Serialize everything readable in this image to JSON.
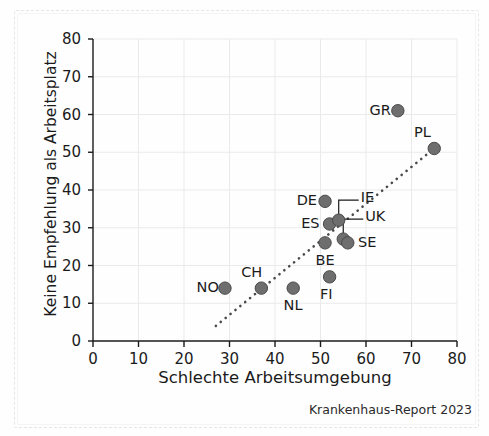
{
  "figure": {
    "source_note": "Krankenhaus-Report 2023"
  },
  "chart_data": {
    "type": "scatter",
    "title": "",
    "subtitle": "",
    "xlabel": "Schlechte Arbeitsumgebung",
    "ylabel": "Keine Empfehlung als Arbeitsplatz",
    "xlim": [
      0,
      80
    ],
    "ylim": [
      0,
      80
    ],
    "xticks": [
      0,
      10,
      20,
      30,
      40,
      50,
      60,
      70,
      80
    ],
    "yticks": [
      0,
      10,
      20,
      30,
      40,
      50,
      60,
      70,
      80
    ],
    "grid": true,
    "legend": "none",
    "marker_color": "#6e6e6e",
    "marker_edge_color": "#4a4a4a",
    "trendline": {
      "style": "dotted",
      "color": "#4a4a4a",
      "x_start": 27,
      "y_start": 4,
      "x_end": 76,
      "y_end": 52
    },
    "annotations": [
      {
        "label": "IE",
        "leader": true
      },
      {
        "label": "UK",
        "leader": true
      }
    ],
    "points": [
      {
        "label": "NO",
        "x": 29,
        "y": 14,
        "label_pos": "left"
      },
      {
        "label": "CH",
        "x": 37,
        "y": 14,
        "label_pos": "above-left"
      },
      {
        "label": "NL",
        "x": 44,
        "y": 14,
        "label_pos": "below"
      },
      {
        "label": "FI",
        "x": 52,
        "y": 17,
        "label_pos": "below"
      },
      {
        "label": "BE",
        "x": 51,
        "y": 26,
        "label_pos": "below"
      },
      {
        "label": "ES",
        "x": 52,
        "y": 31,
        "label_pos": "left"
      },
      {
        "label": "DE",
        "x": 51,
        "y": 37,
        "label_pos": "left"
      },
      {
        "label": "IE",
        "x": 54,
        "y": 32,
        "label_pos": "leader-upper-right"
      },
      {
        "label": "UK",
        "x": 55,
        "y": 27,
        "label_pos": "leader-upper-right"
      },
      {
        "label": "SE",
        "x": 56,
        "y": 26,
        "label_pos": "right"
      },
      {
        "label": "GR",
        "x": 67,
        "y": 61,
        "label_pos": "left"
      },
      {
        "label": "PL",
        "x": 75,
        "y": 51,
        "label_pos": "above-left"
      }
    ]
  }
}
